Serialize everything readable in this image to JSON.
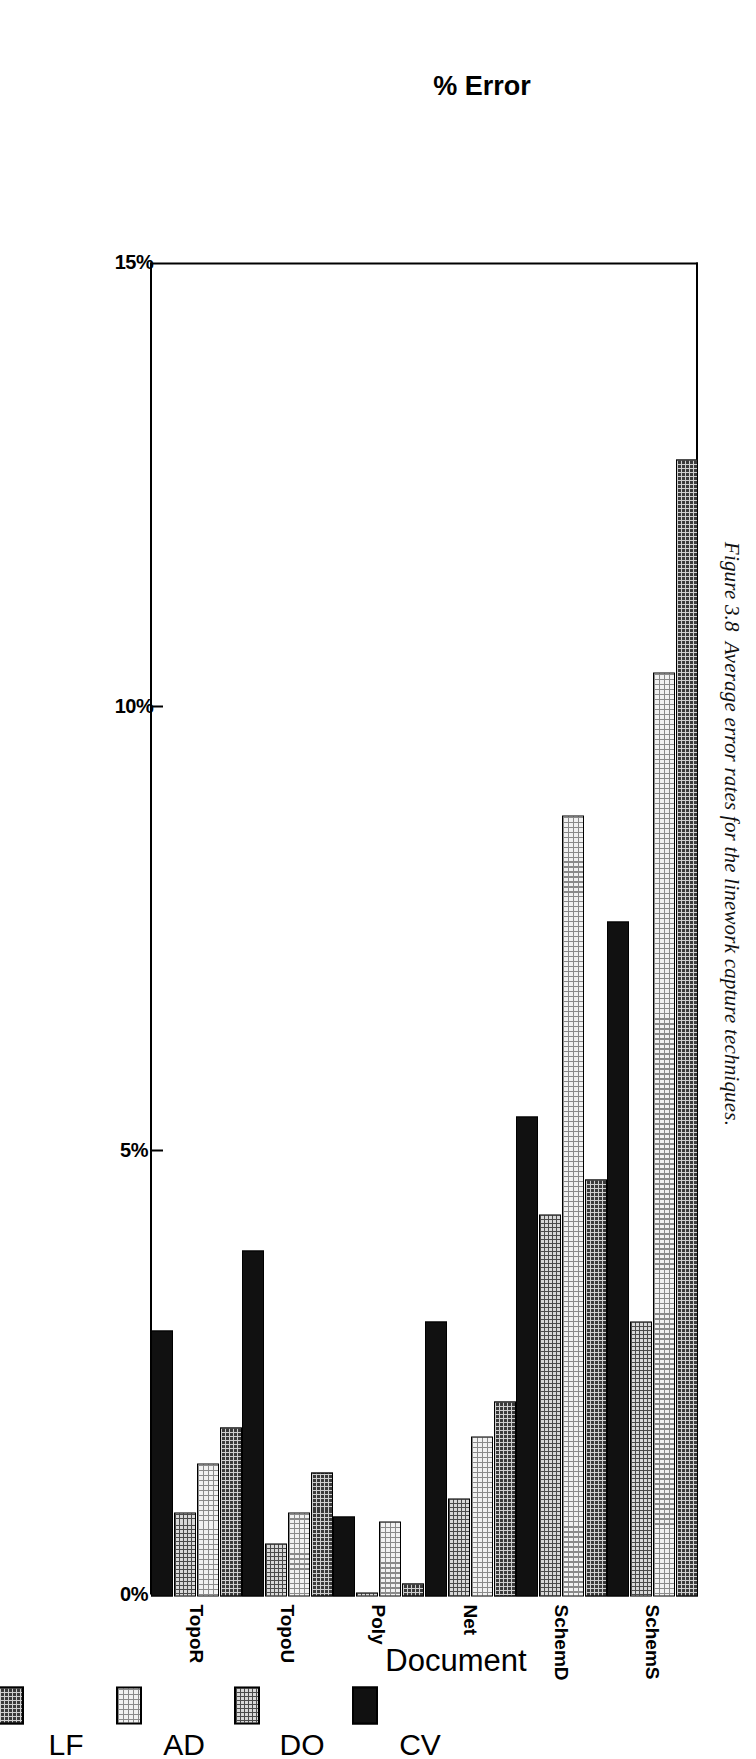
{
  "caption": {
    "number": "Figure 3.8",
    "text": "Average error rates for the linework capture techniques."
  },
  "chart_data": {
    "type": "bar",
    "orientation": "horizontal",
    "title": "",
    "xlabel": "Document",
    "ylabel": "% Error",
    "categories": [
      "TopoR",
      "TopoU",
      "Poly",
      "Net",
      "SchemD",
      "SchemS"
    ],
    "value_axis_ticks": [
      "0%",
      "5%",
      "10%",
      "15%"
    ],
    "value_axis_tick_values": [
      0,
      5,
      10,
      15
    ],
    "ylim": [
      0,
      15
    ],
    "grid": false,
    "legend_position": "below-axis",
    "series": [
      {
        "name": "CV",
        "color": "#111111",
        "pattern": "solid-black",
        "values": [
          3.0,
          3.9,
          0.9,
          3.1,
          5.4,
          7.6
        ]
      },
      {
        "name": "DO",
        "color": "#d8d8d8",
        "pattern": "medium-dot",
        "values": [
          0.95,
          0.6,
          0.05,
          1.1,
          4.3,
          3.1
        ]
      },
      {
        "name": "AD",
        "color": "#f2f2f2",
        "pattern": "light-dot",
        "values": [
          1.5,
          0.95,
          0.85,
          1.8,
          8.8,
          10.4
        ]
      },
      {
        "name": "LF",
        "color": "#3a3a3a",
        "pattern": "dark-dense-dot",
        "values": [
          1.9,
          1.4,
          0.15,
          2.2,
          4.7,
          12.8
        ]
      }
    ]
  },
  "legend": {
    "items": [
      {
        "label": "CV",
        "swatch": "fill-CV"
      },
      {
        "label": "DO",
        "swatch": "fill-DO"
      },
      {
        "label": "AD",
        "swatch": "fill-AD"
      },
      {
        "label": "LF",
        "swatch": "fill-LF"
      }
    ]
  },
  "ghost_text": "linework capture"
}
